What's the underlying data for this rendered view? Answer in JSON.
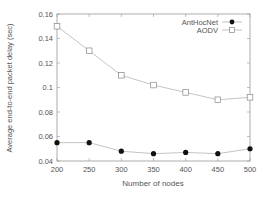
{
  "chart_data": {
    "type": "line",
    "title": "",
    "xlabel": "Number of nodes",
    "ylabel": "Average end-to-end packet delay (sec)",
    "x": [
      200,
      250,
      300,
      350,
      400,
      450,
      500
    ],
    "xlim": [
      200,
      500
    ],
    "ylim": [
      0.04,
      0.16
    ],
    "xticks": [
      "200",
      "250",
      "300",
      "350",
      "400",
      "450",
      "500"
    ],
    "yticks": [
      "0.04",
      "0.06",
      "0.08",
      "0.1",
      "0.12",
      "0.14",
      "0.16"
    ],
    "grid": false,
    "legend_position": "top-right",
    "series": [
      {
        "name": "AntHocNet",
        "marker": "filled-circle",
        "values": [
          0.055,
          0.055,
          0.048,
          0.046,
          0.047,
          0.046,
          0.05
        ]
      },
      {
        "name": "AODV",
        "marker": "open-square",
        "values": [
          0.15,
          0.13,
          0.11,
          0.102,
          0.096,
          0.09,
          0.092
        ]
      }
    ]
  }
}
